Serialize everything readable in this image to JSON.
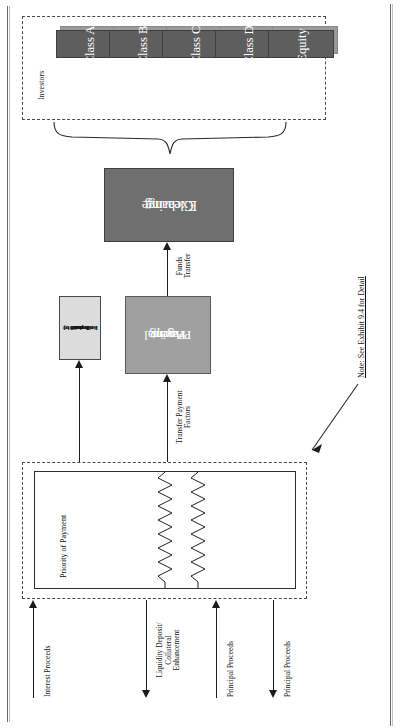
{
  "document": {
    "kind": "securitization-cash-flow-diagram",
    "orientation": "text rotated 90 degrees (landscape page scanned portrait)"
  },
  "investors": {
    "group_label": "Investors",
    "tranches": [
      {
        "label": "Class A"
      },
      {
        "label": "Class B"
      },
      {
        "label": "Class C"
      },
      {
        "label": "Class D"
      },
      {
        "label": "Equity"
      }
    ]
  },
  "boxes": {
    "clearing_exchange": {
      "line1": "Clearing",
      "line2": "Exchange"
    },
    "paying_agent": {
      "line1": "Principal",
      "line2": "Paying",
      "line3": "Agent"
    },
    "fees": {
      "line1": "Fees paid by",
      "line2": "Trustee",
      "line3": "on behalf of",
      "line4": "Issuer"
    }
  },
  "flows": {
    "funds_transfer": {
      "line1": "Funds",
      "line2": "Transfer"
    },
    "transfer_payment_factors": {
      "line1": "Transfer Payment",
      "line2": "Factors"
    }
  },
  "priority_of_payment": {
    "label": "Priority of Payment"
  },
  "outflows": [
    {
      "label_lines": [
        "Interest Proceeds"
      ],
      "direction": "up"
    },
    {
      "label_lines": [
        "Liquidity Deposit/",
        "Collateral",
        "Enhancement"
      ],
      "direction": "down"
    },
    {
      "label_lines": [
        "Principal Proceeds"
      ],
      "direction": "up"
    },
    {
      "label_lines": [
        "Principal Proceeds"
      ],
      "direction": "down"
    }
  ],
  "note": {
    "text": "Note: See Exhibit 9.4 for Detail"
  },
  "colors": {
    "tranche_face": "#5e5e5e",
    "tranche_shadow": "#9a9a9a",
    "clearing_exchange": "#6f6f6f",
    "paying_agent": "#a0a0a0",
    "fees_box": "#dcdcdc",
    "line": "#1c1c1c",
    "dashed_border": "#4a4a4a"
  }
}
